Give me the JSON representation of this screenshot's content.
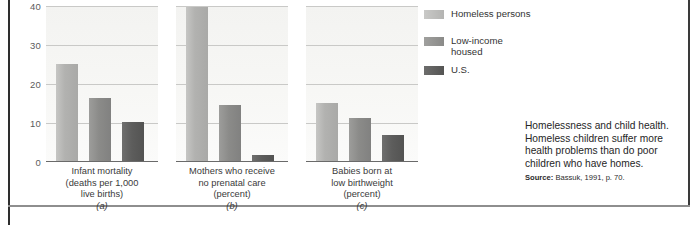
{
  "chart_data": {
    "type": "bar",
    "title": "Homelessness and child health",
    "xlabel": "",
    "ylabel": "",
    "ylim": [
      0,
      40
    ],
    "yticks": [
      "40",
      "30",
      "20",
      "10",
      "0"
    ],
    "grid": true,
    "legend_position": "right",
    "categories": [
      "Infant mortality (deaths per 1,000 live births)",
      "Mothers who receive no prenatal care (percent)",
      "Babies born at low birthweight (percent)"
    ],
    "series": [
      {
        "name": "Homeless persons",
        "color": "#b4b4b2",
        "values": [
          25,
          40,
          15
        ]
      },
      {
        "name": "Low-income housed",
        "color": "#8a8a88",
        "values": [
          16.2,
          14.5,
          11
        ]
      },
      {
        "name": "U.S.",
        "color": "#545453",
        "values": [
          10,
          1.5,
          6.5
        ]
      }
    ],
    "panels": [
      {
        "lines": [
          "Infant mortality",
          "(deaths per 1,000",
          "live births)"
        ],
        "letter": "(a)",
        "values": [
          25,
          16.2,
          10
        ]
      },
      {
        "lines": [
          "Mothers who receive",
          "no prenatal care",
          "(percent)"
        ],
        "letter": "(b)",
        "values": [
          40,
          14.5,
          1.5
        ]
      },
      {
        "lines": [
          "Babies born at",
          "low birthweight",
          "(percent)"
        ],
        "letter": "(c)",
        "values": [
          15,
          11,
          6.5
        ]
      }
    ]
  },
  "legend": {
    "items": [
      {
        "label": "Homeless persons"
      },
      {
        "label": "Low-income housed"
      },
      {
        "label": "U.S."
      }
    ]
  },
  "caption": {
    "text": "Homelessness and child health. Homeless children suffer more health problems than do poor children who have homes.",
    "source_label": "Source:",
    "source_text": "Bassuk, 1991, p. 70."
  }
}
